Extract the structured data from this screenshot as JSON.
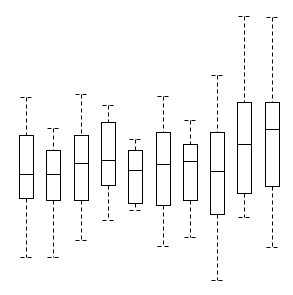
{
  "chart_data": {
    "type": "boxplot",
    "title": "",
    "xlabel": "",
    "ylabel": "",
    "grid": false,
    "axes_visible": false,
    "legend": null,
    "value_scale_note": "values in pixel units measured upward from bottom of image (no axis shown)",
    "ylim": [
      0,
      295
    ],
    "categories": [
      "1",
      "2",
      "3",
      "4",
      "5",
      "6",
      "7",
      "8",
      "9",
      "10"
    ],
    "series": [
      {
        "name": "box-1",
        "whisker_high": 198,
        "q3": 160,
        "median": 121,
        "q1": 97,
        "whisker_low": 38
      },
      {
        "name": "box-2",
        "whisker_high": 167,
        "q3": 145,
        "median": 121,
        "q1": 95,
        "whisker_low": 38
      },
      {
        "name": "box-3",
        "whisker_high": 201,
        "q3": 160,
        "median": 132,
        "q1": 95,
        "whisker_low": 55
      },
      {
        "name": "box-4",
        "whisker_high": 190,
        "q3": 173,
        "median": 135,
        "q1": 110,
        "whisker_low": 75
      },
      {
        "name": "box-5",
        "whisker_high": 156,
        "q3": 145,
        "median": 125,
        "q1": 92,
        "whisker_low": 85
      },
      {
        "name": "box-6",
        "whisker_high": 199,
        "q3": 163,
        "median": 131,
        "q1": 90,
        "whisker_low": 49
      },
      {
        "name": "box-7",
        "whisker_high": 175,
        "q3": 151,
        "median": 134,
        "q1": 95,
        "whisker_low": 58
      },
      {
        "name": "box-8",
        "whisker_high": 220,
        "q3": 163,
        "median": 124,
        "q1": 81,
        "whisker_low": 15
      },
      {
        "name": "box-9",
        "whisker_high": 279,
        "q3": 193,
        "median": 151,
        "q1": 102,
        "whisker_low": 78
      },
      {
        "name": "box-10",
        "whisker_high": 278,
        "q3": 193,
        "median": 166,
        "q1": 109,
        "whisker_low": 48
      }
    ]
  },
  "layout": {
    "width": 293,
    "height": 295,
    "first_center_x": 26,
    "spacing_x": 27.3,
    "box_width": 14,
    "cap_width": 12,
    "stroke_color": "#000000",
    "box_fill": "#ffffff"
  }
}
